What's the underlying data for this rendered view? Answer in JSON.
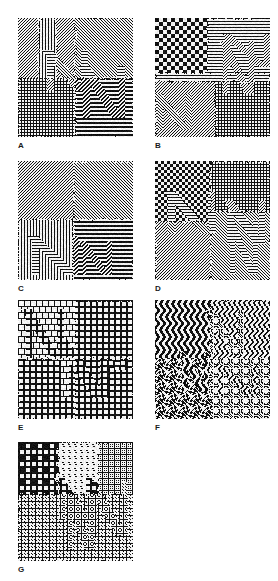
{
  "figure": {
    "kind": "texture-pattern-grid",
    "background_color": "#ffffff",
    "ink_color": "#111111",
    "columns": 2,
    "rows": 4,
    "panel_count": 7,
    "panel_width": 115,
    "panel_height": 119,
    "col_x": [
      18,
      155
    ],
    "row_y": [
      18,
      161,
      300,
      442
    ],
    "label_offset_y": 123,
    "label_offset_x": 0
  },
  "panels": [
    {
      "id": "A",
      "label": "A",
      "col": 0,
      "row": 0,
      "description": "Oriented line textures with embedded letter-like shapes; left half fine diagonal hatch over crosshatch, right half horizontal and diagonal stripe regions",
      "regions": [
        {
          "name": "upper-left-diagonal-hatch",
          "pattern": "diagonal-45",
          "period": 3,
          "x": 0,
          "y": 0,
          "w": 57,
          "h": 60
        },
        {
          "name": "upper-left-vertical-bars",
          "pattern": "vertical",
          "period": 3,
          "x": 20,
          "y": 0,
          "w": 18,
          "h": 60
        },
        {
          "name": "lower-left-crosshatch",
          "pattern": "grid",
          "period": 3,
          "x": 0,
          "y": 60,
          "w": 57,
          "h": 59
        },
        {
          "name": "upper-right-horizontal",
          "pattern": "horizontal",
          "period": 3,
          "x": 57,
          "y": 0,
          "w": 58,
          "h": 60
        },
        {
          "name": "right-diagonal-chevron",
          "pattern": "diagonal-135",
          "period": 3,
          "x": 57,
          "y": 0,
          "w": 58,
          "h": 119
        },
        {
          "name": "lower-right-horizontal",
          "pattern": "horizontal",
          "period": 4,
          "x": 57,
          "y": 60,
          "w": 58,
          "h": 59
        }
      ],
      "shape_letters": [
        "N",
        "N"
      ]
    },
    {
      "id": "B",
      "label": "B",
      "col": 1,
      "row": 0,
      "description": "Checkerboard upper-left, horizontal stripes upper-right with diagonal letter shapes; lower half diagonal hatch with light grid letter N at right",
      "regions": [
        {
          "name": "upper-left-checker",
          "pattern": "checker",
          "period": 4,
          "x": 0,
          "y": 0,
          "w": 52,
          "h": 55
        },
        {
          "name": "upper-right-horizontal",
          "pattern": "horizontal",
          "period": 3,
          "x": 52,
          "y": 0,
          "w": 63,
          "h": 55
        },
        {
          "name": "mid-band-horizontal",
          "pattern": "horizontal",
          "period": 3,
          "x": 0,
          "y": 55,
          "w": 115,
          "h": 8
        },
        {
          "name": "lower-left-diagonal",
          "pattern": "diagonal-45",
          "period": 3,
          "x": 0,
          "y": 63,
          "w": 60,
          "h": 56
        },
        {
          "name": "lower-right-grid",
          "pattern": "grid",
          "period": 3,
          "x": 60,
          "y": 63,
          "w": 55,
          "h": 56
        }
      ],
      "shape_letters": [
        "N",
        "N",
        "N"
      ]
    },
    {
      "id": "C",
      "label": "C",
      "col": 0,
      "row": 1,
      "description": "Upper half diagonal hatch at two orientations; lower-left vertical bars over diagonal, lower-right horizontal bars with maze-like shape",
      "regions": [
        {
          "name": "upper-left-diagonal",
          "pattern": "diagonal-45",
          "period": 3,
          "x": 0,
          "y": 0,
          "w": 55,
          "h": 58
        },
        {
          "name": "upper-right-diagonal",
          "pattern": "diagonal-135",
          "period": 3,
          "x": 55,
          "y": 0,
          "w": 60,
          "h": 58
        },
        {
          "name": "lower-left-vertical",
          "pattern": "vertical",
          "period": 3,
          "x": 0,
          "y": 58,
          "w": 55,
          "h": 61
        },
        {
          "name": "lower-right-horizontal",
          "pattern": "horizontal",
          "period": 4,
          "x": 55,
          "y": 58,
          "w": 60,
          "h": 61
        }
      ],
      "shape_letters": [
        "N"
      ]
    },
    {
      "id": "D",
      "label": "D",
      "col": 1,
      "row": 1,
      "description": "Dense checkerboard left, light grid upper-right with diagonal N, diagonal chevrons lower half",
      "regions": [
        {
          "name": "left-checker",
          "pattern": "checker",
          "period": 3,
          "x": 0,
          "y": 0,
          "w": 55,
          "h": 60
        },
        {
          "name": "upper-right-lightgrid",
          "pattern": "grid",
          "period": 3,
          "x": 55,
          "y": 0,
          "w": 60,
          "h": 50
        },
        {
          "name": "lower-left-diagonal",
          "pattern": "diagonal-45",
          "period": 3,
          "x": 0,
          "y": 60,
          "w": 55,
          "h": 59
        },
        {
          "name": "lower-right-diagonal",
          "pattern": "diagonal-135",
          "period": 3,
          "x": 55,
          "y": 50,
          "w": 60,
          "h": 69
        }
      ],
      "shape_letters": [
        "N",
        "N"
      ]
    },
    {
      "id": "E",
      "label": "E",
      "col": 0,
      "row": 2,
      "description": "Square-dot lattice micro-texture over diagonal and horizontal stripe fields; blob shapes visible by texel orientation change",
      "regions": [
        {
          "name": "upper-left-diagonal-squares",
          "pattern": "square-lattice-diagonal",
          "period": 6,
          "x": 0,
          "y": 0,
          "w": 57,
          "h": 58
        },
        {
          "name": "upper-right-horizontal-squares",
          "pattern": "square-lattice-horizontal",
          "period": 6,
          "x": 57,
          "y": 0,
          "w": 58,
          "h": 58
        },
        {
          "name": "lower-left-square-lattice",
          "pattern": "square-lattice",
          "period": 6,
          "x": 0,
          "y": 58,
          "w": 57,
          "h": 61
        },
        {
          "name": "lower-right-vertical-squares",
          "pattern": "square-lattice-vertical",
          "period": 6,
          "x": 57,
          "y": 58,
          "w": 58,
          "h": 61
        }
      ],
      "shape_letters": [
        "N"
      ]
    },
    {
      "id": "F",
      "label": "F",
      "col": 1,
      "row": 2,
      "description": "Wavy sinusoidal micro-texture fields: vertical waves upper-left and upper-right, horizontal wave weave lower half",
      "regions": [
        {
          "name": "upper-left-vertical-waves",
          "pattern": "wave-vertical",
          "period": 6,
          "x": 0,
          "y": 0,
          "w": 55,
          "h": 58
        },
        {
          "name": "upper-right-vertical-waves-dense",
          "pattern": "wave-vertical",
          "period": 5,
          "x": 55,
          "y": 0,
          "w": 60,
          "h": 58
        },
        {
          "name": "lower-left-wave-weave",
          "pattern": "wave-weave",
          "period": 6,
          "x": 0,
          "y": 58,
          "w": 55,
          "h": 61
        },
        {
          "name": "lower-right-wave-weave",
          "pattern": "wave-weave",
          "period": 5,
          "x": 55,
          "y": 58,
          "w": 60,
          "h": 61
        }
      ],
      "shape_letters": [
        "N"
      ]
    },
    {
      "id": "G",
      "label": "G",
      "col": 0,
      "row": 3,
      "description": "Upper half plaid grid with slanted ellipse texels, lower half interlocking braid/knot texture",
      "regions": [
        {
          "name": "upper-left-plaid",
          "pattern": "plaid",
          "period": 6,
          "x": 0,
          "y": 0,
          "w": 40,
          "h": 52
        },
        {
          "name": "upper-mid-ellipse-slant",
          "pattern": "ellipse-slant",
          "period": 6,
          "x": 40,
          "y": 0,
          "w": 40,
          "h": 52
        },
        {
          "name": "upper-right-grid-ellipse",
          "pattern": "grid-ellipse",
          "period": 6,
          "x": 80,
          "y": 0,
          "w": 35,
          "h": 52
        },
        {
          "name": "lower-braid",
          "pattern": "braid",
          "period": 7,
          "x": 0,
          "y": 52,
          "w": 115,
          "h": 67
        }
      ],
      "shape_letters": [
        "N"
      ]
    }
  ],
  "labels": {
    "A": "A",
    "B": "B",
    "C": "C",
    "D": "D",
    "E": "E",
    "F": "F",
    "G": "G"
  }
}
